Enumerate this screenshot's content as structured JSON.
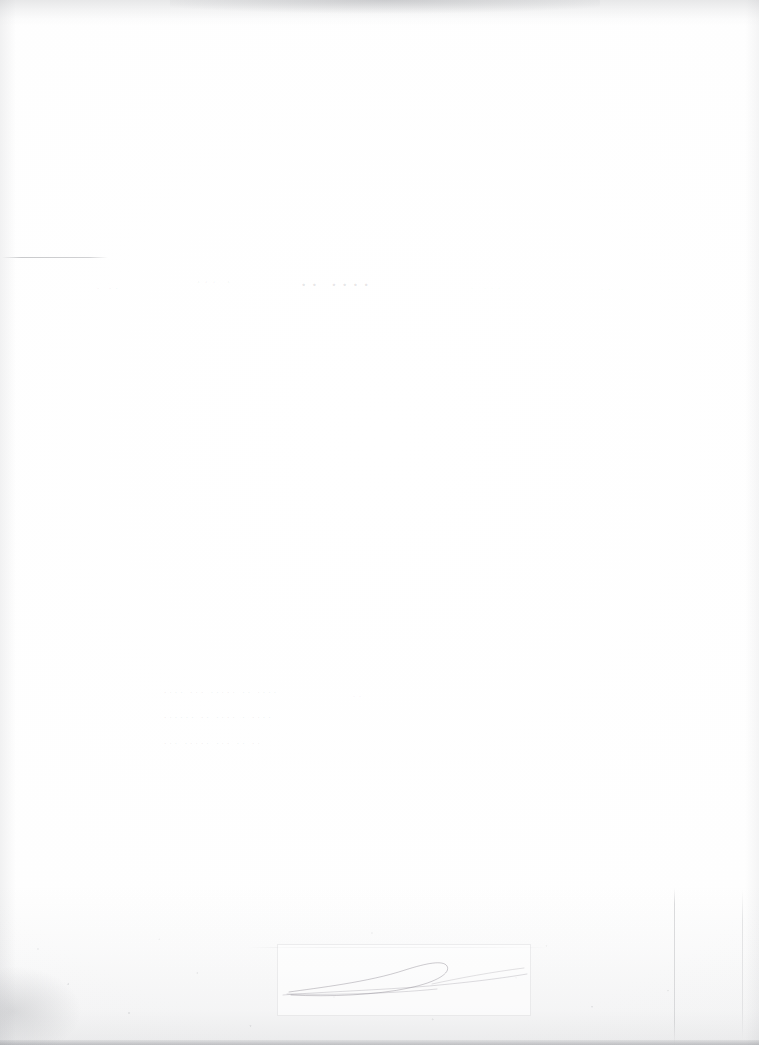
{
  "document": {
    "kind": "faded-scanned-page",
    "legibility": "illegible",
    "page_width": 759,
    "page_height": 1045,
    "paper_color": "#fefefe",
    "ink_color": "#5c5e66",
    "flourish_color": "#76707c",
    "edge_shadow_color": "#787a80"
  },
  "header": {
    "rule_present": true,
    "fragments": [
      {
        "name": "left-fragment",
        "text": "· ··"
      },
      {
        "name": "mid-fragment",
        "text": "··· ·"
      },
      {
        "name": "title-fragment",
        "text": "·· ····"
      },
      {
        "name": "right-fragment",
        "text": "· ···"
      },
      {
        "name": "far-right-fragment",
        "text": "·· ·"
      }
    ]
  },
  "body": {
    "lines": [
      {
        "name": "body-line-1",
        "text": "···· ··· ····· ··   ····"
      },
      {
        "name": "body-line-2",
        "text": "······ ·· ····   · ····"
      },
      {
        "name": "body-line-3",
        "text": "··· ····· ···    ··  ··"
      }
    ],
    "right_speck": "··"
  },
  "signature": {
    "box_present": true,
    "flourish_present": true,
    "tail_extends_right": true
  },
  "artifacts": {
    "top_edge_smudge": true,
    "bottom_scan_noise": true,
    "bottom_left_blotch": true,
    "vertical_creases": 2,
    "left_gutter_shadow": true,
    "right_gutter_shadow": true
  }
}
